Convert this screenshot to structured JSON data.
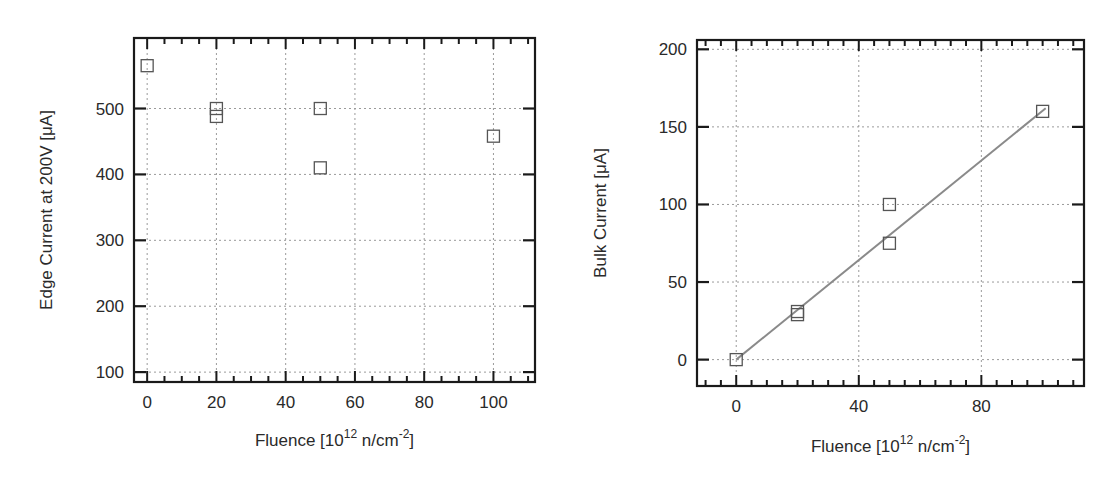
{
  "chart_data": [
    {
      "type": "scatter",
      "title": "",
      "xlabel": "Fluence [10^12 n/cm^-2]",
      "xlabel_parts": {
        "pre": "Fluence [10",
        "sup1": "12",
        "mid": " n/cm",
        "sup2": "-2",
        "post": "]"
      },
      "ylabel": "Edge Current at 200V [μA]",
      "xlim": [
        -3.8,
        112
      ],
      "ylim": [
        85,
        607
      ],
      "xticks": [
        0,
        20,
        40,
        60,
        80,
        100
      ],
      "xminor_step": 5,
      "yticks": [
        100,
        200,
        300,
        400,
        500
      ],
      "yminor_step": null,
      "grid": true,
      "legend": null,
      "series": [
        {
          "name": "Edge current",
          "marker": "open-square",
          "points": [
            {
              "x": 0,
              "y": 565
            },
            {
              "x": 20,
              "y": 500
            },
            {
              "x": 20,
              "y": 488
            },
            {
              "x": 50,
              "y": 500
            },
            {
              "x": 50,
              "y": 410
            },
            {
              "x": 100,
              "y": 458
            }
          ]
        }
      ]
    },
    {
      "type": "scatter",
      "title": "",
      "xlabel": "Fluence [10^12 n/cm^-2]",
      "xlabel_parts": {
        "pre": "Fluence [10",
        "sup1": "12",
        "mid": " n/cm",
        "sup2": "-2",
        "post": "]"
      },
      "ylabel": "Bulk Current [μA]",
      "xlim": [
        -12.8,
        113.5
      ],
      "ylim": [
        -17,
        206
      ],
      "xticks": [
        0,
        40,
        80
      ],
      "xminor_step": 5,
      "yticks": [
        0,
        50,
        100,
        150,
        200
      ],
      "grid": true,
      "legend": null,
      "series": [
        {
          "name": "Bulk current",
          "marker": "open-square",
          "points": [
            {
              "x": 0,
              "y": 0
            },
            {
              "x": 20,
              "y": 31
            },
            {
              "x": 20,
              "y": 29
            },
            {
              "x": 50,
              "y": 100
            },
            {
              "x": 50,
              "y": 75
            },
            {
              "x": 100,
              "y": 160
            }
          ]
        },
        {
          "name": "Linear fit",
          "type": "line",
          "color": "#8a8a8a",
          "points": [
            {
              "x": 0,
              "y": 0
            },
            {
              "x": 101,
              "y": 162
            }
          ]
        }
      ]
    }
  ],
  "layout": {
    "panels": [
      {
        "left": 134,
        "top": 38,
        "right": 535,
        "bottom": 382,
        "ylabel_x": 52,
        "xlabel_y": 446
      },
      {
        "left": 697,
        "top": 40,
        "right": 1084,
        "bottom": 386,
        "ylabel_x": 606,
        "xlabel_y": 452
      }
    ]
  },
  "colors": {
    "frame": "#1a1a1a",
    "grid": "#9a9a9a",
    "marker": "#555555",
    "fit_line": "#8a8a8a"
  }
}
